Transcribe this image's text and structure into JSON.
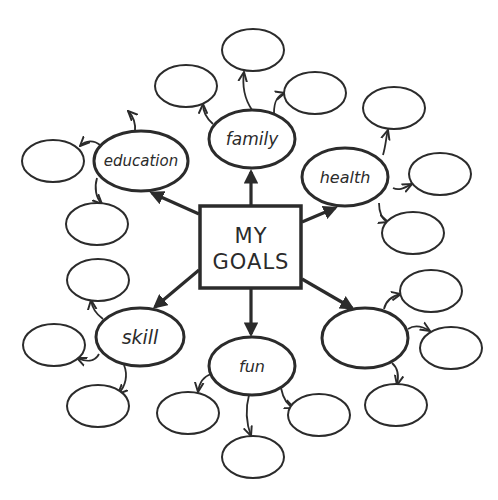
{
  "center": {
    "line1": "MY",
    "line2": "GOALS"
  },
  "branches": [
    {
      "id": "family",
      "label": "family",
      "sub_count": 2
    },
    {
      "id": "education",
      "label": "education",
      "sub_count": 3
    },
    {
      "id": "health",
      "label": "health",
      "sub_count": 3
    },
    {
      "id": "unlabeled",
      "label": "",
      "sub_count": 3
    },
    {
      "id": "fun",
      "label": "fun",
      "sub_count": 3
    },
    {
      "id": "skill",
      "label": "skill",
      "sub_count": 3
    }
  ],
  "colors": {
    "stroke": "#2b2b2b",
    "background": "#ffffff"
  }
}
